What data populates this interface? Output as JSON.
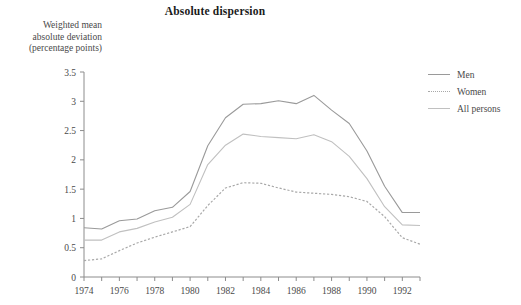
{
  "chart_data": {
    "type": "line",
    "title": "Absolute dispersion",
    "ylabel": "Weighted mean\nabsolute deviation\n(percentage points)",
    "xlabel": "",
    "ylim": [
      0,
      3.5
    ],
    "xlim": [
      1974,
      1993
    ],
    "grid": false,
    "legend_position": "right",
    "y_ticks": [
      "0",
      "0.5",
      "1",
      "1.5",
      "2",
      "2.5",
      "3",
      "3.5"
    ],
    "y_tick_values": [
      0,
      0.5,
      1,
      1.5,
      2,
      2.5,
      3,
      3.5
    ],
    "x_ticks": [
      "1974",
      "1976",
      "1978",
      "1980",
      "1982",
      "1984",
      "1986",
      "1988",
      "1990",
      "1992"
    ],
    "x_tick_values": [
      1974,
      1976,
      1978,
      1980,
      1982,
      1984,
      1986,
      1988,
      1990,
      1992
    ],
    "x": [
      1974,
      1975,
      1976,
      1977,
      1978,
      1979,
      1980,
      1981,
      1982,
      1983,
      1984,
      1985,
      1986,
      1987,
      1988,
      1989,
      1990,
      1991,
      1992,
      1993
    ],
    "series": [
      {
        "name": "Men",
        "style": "solid",
        "color": "#9a9a9a",
        "values": [
          0.84,
          0.82,
          0.96,
          0.99,
          1.13,
          1.19,
          1.46,
          2.24,
          2.72,
          2.95,
          2.96,
          3.01,
          2.96,
          3.1,
          2.85,
          2.62,
          2.15,
          1.55,
          1.1,
          1.1
        ]
      },
      {
        "name": "Women",
        "style": "dotted",
        "color": "#a8a8a8",
        "values": [
          0.28,
          0.31,
          0.45,
          0.58,
          0.68,
          0.77,
          0.86,
          1.22,
          1.52,
          1.61,
          1.6,
          1.52,
          1.45,
          1.43,
          1.41,
          1.37,
          1.29,
          1.03,
          0.67,
          0.56
        ]
      },
      {
        "name": "All persons",
        "style": "solid",
        "color": "#c0c0c0",
        "values": [
          0.63,
          0.63,
          0.77,
          0.83,
          0.94,
          1.02,
          1.24,
          1.92,
          2.25,
          2.44,
          2.4,
          2.38,
          2.36,
          2.43,
          2.31,
          2.06,
          1.68,
          1.2,
          0.89,
          0.88
        ]
      }
    ]
  },
  "legend": {
    "items": [
      {
        "label": "Men"
      },
      {
        "label": "Women"
      },
      {
        "label": "All persons"
      }
    ]
  }
}
